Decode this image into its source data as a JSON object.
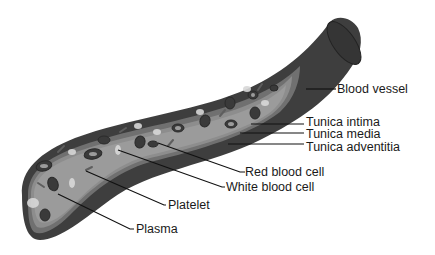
{
  "diagram": {
    "colors": {
      "outer_wall": "#3e3e3e",
      "media_band": "#6f6f6f",
      "intima_band": "#8f8f8f",
      "lumen_plasma": "#9a9a9a",
      "red_cell": "#3a3a3a",
      "white_cell": "#d8d8d8",
      "platelet": "#6a6a6a",
      "leader_line": "#111111",
      "text": "#1a1a1a"
    },
    "labels": {
      "blood_vessel": "Blood vessel",
      "tunica_intima": "Tunica intima",
      "tunica_media": "Tunica media",
      "tunica_adventitia": "Tunica adventitia",
      "red_blood_cell": "Red blood cell",
      "white_blood_cell": "White blood cell",
      "platelet": "Platelet",
      "plasma": "Plasma"
    }
  }
}
